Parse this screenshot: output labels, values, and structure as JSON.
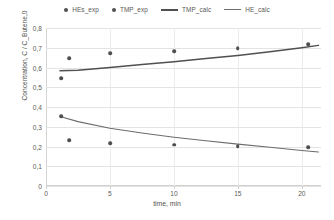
{
  "legend": {
    "items": [
      {
        "label": "HEs_exp",
        "kind": "dot"
      },
      {
        "label": "TMP_exp",
        "kind": "dot"
      },
      {
        "label": "TMP_calc",
        "kind": "line"
      },
      {
        "label": "HE_calc",
        "kind": "line-thin"
      }
    ]
  },
  "axes": {
    "ylabel": "Concentration, C / C_Butene,0",
    "xlabel": "time, min",
    "yticks": [
      "0",
      "0,1",
      "0,2",
      "0,3",
      "0,4",
      "0,5",
      "0,6",
      "0,7",
      "0,8"
    ],
    "xticks": [
      "0",
      "5",
      "10",
      "15",
      "20"
    ]
  },
  "colors": {
    "marker": "#4f4e4d",
    "tmp_curve": "#51504f",
    "he_curve": "#6d6c6b",
    "grid": "#e3e3e3",
    "text": "#595857",
    "background": "#ffffff"
  },
  "chart_data": {
    "type": "scatter",
    "title": "",
    "xlabel": "time, min",
    "ylabel": "Concentration, C / C_Butene,0",
    "xlim": [
      0,
      21.5
    ],
    "ylim": [
      0,
      0.8
    ],
    "grid": true,
    "legend_position": "top-center",
    "decimal_separator": ",",
    "series": [
      {
        "name": "TMP_exp",
        "type": "scatter",
        "marker": "circle",
        "x": [
          1.2,
          1.8,
          5.0,
          10.0,
          15.0,
          20.5
        ],
        "y": [
          0.545,
          0.648,
          0.672,
          0.682,
          0.697,
          0.717
        ]
      },
      {
        "name": "HEs_exp",
        "type": "scatter",
        "marker": "circle",
        "x": [
          1.2,
          1.8,
          5.0,
          10.0,
          15.0,
          20.5
        ],
        "y": [
          0.352,
          0.232,
          0.216,
          0.209,
          0.203,
          0.197
        ]
      },
      {
        "name": "TMP_calc",
        "type": "line",
        "x": [
          1.1,
          2.5,
          5.0,
          7.5,
          10.0,
          12.5,
          15.0,
          17.5,
          20.0,
          21.3
        ],
        "y": [
          0.583,
          0.586,
          0.6,
          0.615,
          0.629,
          0.645,
          0.661,
          0.68,
          0.7,
          0.712
        ]
      },
      {
        "name": "HE_calc",
        "type": "line",
        "x": [
          1.1,
          2.5,
          5.0,
          7.5,
          10.0,
          12.5,
          15.0,
          17.5,
          20.0,
          21.3
        ],
        "y": [
          0.352,
          0.326,
          0.292,
          0.268,
          0.247,
          0.229,
          0.212,
          0.196,
          0.18,
          0.172
        ]
      }
    ]
  }
}
